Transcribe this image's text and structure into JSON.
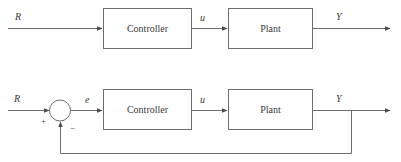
{
  "figure": {
    "type": "control-system-block-diagram",
    "line_color": "#6e6e6e",
    "text_color": "#3b3b3b",
    "background": "#ffffff"
  },
  "diagrams": [
    {
      "id": "open-loop",
      "name": "open-loop-block-diagram",
      "signals": {
        "input": "R",
        "control": "u",
        "output": "Y"
      },
      "blocks": [
        {
          "label": "Controller"
        },
        {
          "label": "Plant"
        }
      ]
    },
    {
      "id": "closed-loop",
      "name": "closed-loop-block-diagram",
      "signals": {
        "input": "R",
        "error": "e",
        "control": "u",
        "output": "Y"
      },
      "summing_junction": {
        "positive_sign": "+",
        "negative_sign": "−"
      },
      "blocks": [
        {
          "label": "Controller"
        },
        {
          "label": "Plant"
        }
      ]
    }
  ]
}
